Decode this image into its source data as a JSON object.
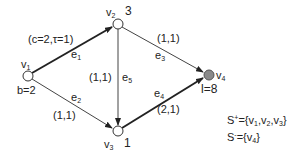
{
  "diagram": {
    "nodes": [
      {
        "id": "v1",
        "name": "v",
        "sub": "1",
        "annotation": "b=2",
        "fill": "#ffffff"
      },
      {
        "id": "v2",
        "name": "v",
        "sub": "2",
        "annotation": "3",
        "fill": "#ffffff"
      },
      {
        "id": "v3",
        "name": "v",
        "sub": "3",
        "annotation": "1",
        "fill": "#ffffff"
      },
      {
        "id": "v4",
        "name": "v",
        "sub": "4",
        "annotation": "l=8",
        "fill": "#8a8a8a"
      }
    ],
    "edges": [
      {
        "id": "e1",
        "name": "e",
        "sub": "1",
        "from": "v1",
        "to": "v2",
        "label": "(c=2,τ=1)",
        "bold": true
      },
      {
        "id": "e2",
        "name": "e",
        "sub": "2",
        "from": "v1",
        "to": "v3",
        "label": "(1,1)",
        "bold": false
      },
      {
        "id": "e3",
        "name": "e",
        "sub": "3",
        "from": "v2",
        "to": "v4",
        "label": "(1,1)",
        "bold": false
      },
      {
        "id": "e4",
        "name": "e",
        "sub": "4",
        "from": "v3",
        "to": "v4",
        "label": "(2,1)",
        "bold": true
      },
      {
        "id": "e5",
        "name": "e",
        "sub": "5",
        "from": "v2",
        "to": "v3",
        "label": "(1,1)",
        "bold": false
      }
    ],
    "sets": {
      "s_plus": {
        "prefix": "S",
        "sign": "+",
        "eq": "={",
        "items": [
          "v1",
          "v2",
          "v3"
        ],
        "close": "}"
      },
      "s_minus": {
        "prefix": "S",
        "sign": "-",
        "eq": "={",
        "items": [
          "v4"
        ],
        "close": "}"
      }
    }
  }
}
